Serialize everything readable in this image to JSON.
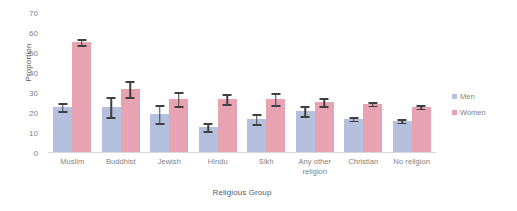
{
  "chart_data": {
    "type": "bar",
    "title": "",
    "xlabel": "Religious Group",
    "ylabel": "Proportion",
    "ylim": [
      0,
      70
    ],
    "yticks": [
      0,
      10,
      20,
      30,
      40,
      50,
      60,
      70
    ],
    "grid": false,
    "legend_position": "right",
    "categories": [
      "Muslim",
      "Buddhist",
      "Jewish",
      "Hindu",
      "Sikh",
      "Any other religion",
      "Christian",
      "No religion"
    ],
    "series": [
      {
        "name": "Men",
        "color": "#b4c0dd",
        "values": [
          23,
          23,
          19.5,
          13,
          17,
          21,
          17,
          16
        ],
        "errors": [
          2,
          5,
          4.5,
          2,
          2.5,
          2.5,
          0.8,
          0.8
        ]
      },
      {
        "name": "Women",
        "color": "#e8a3b2",
        "values": [
          55.5,
          32,
          27,
          27,
          27,
          25.5,
          24.5,
          23
        ],
        "errors": [
          1.5,
          4,
          3.5,
          2.5,
          3,
          2,
          0.8,
          0.8
        ]
      }
    ]
  },
  "axis": {
    "y_title": "Proportion",
    "x_title": "Religious Group",
    "y_tick_labels": [
      "70",
      "60",
      "50",
      "40",
      "30",
      "20",
      "10",
      "0"
    ]
  },
  "legend": {
    "items": [
      {
        "label": "Men",
        "color": "#b4c0dd"
      },
      {
        "label": "Women",
        "color": "#e8a3b2"
      }
    ]
  }
}
